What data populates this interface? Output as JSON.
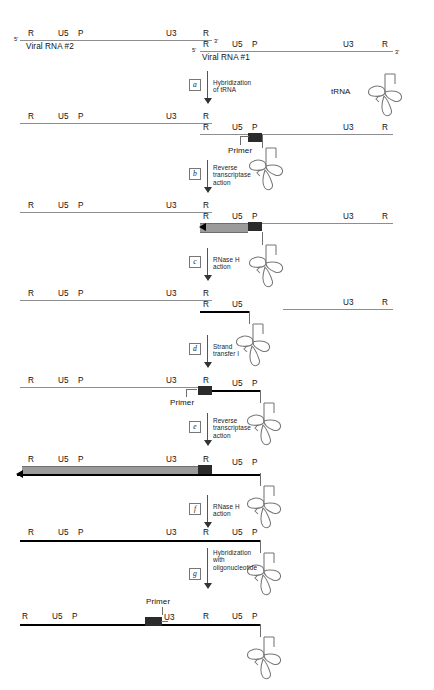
{
  "figure": {
    "colors": {
      "rna_strand": "#8e8e8e",
      "dna_strand": "#000000",
      "primer_block": "#2b2b2b",
      "synthesized_dna_bar": "#9b9b9b",
      "trna_outline": "#777777",
      "background": "#ffffff"
    }
  },
  "segments": {
    "R": "R",
    "U5": "U5",
    "P": "P",
    "U3": "U3",
    "five_prime": "5'",
    "three_prime": "3'"
  },
  "molecules": {
    "viral_rna_2": "Viral RNA #2",
    "viral_rna_1": "Viral RNA #1",
    "trna": "tRNA",
    "primer": "Primer"
  },
  "steps": [
    {
      "id": "a",
      "label": "a",
      "text": "Hybridization\nof tRNA"
    },
    {
      "id": "b",
      "label": "b",
      "text": "Reverse\ntranscriptase\naction"
    },
    {
      "id": "c",
      "label": "c",
      "text": "RNase H\naction"
    },
    {
      "id": "d",
      "label": "d",
      "text": "Strand\ntransfer I"
    },
    {
      "id": "e",
      "label": "e",
      "text": "Reverse\ntranscriptase\naction"
    },
    {
      "id": "f",
      "label": "f",
      "text": "RNase H\naction"
    },
    {
      "id": "g",
      "label": "g",
      "text": "Hybridization\nwith\noligonucleotide"
    }
  ],
  "panels": [
    {
      "id": "panel-1",
      "name": "two-viral-rna-genomes",
      "strands": [
        {
          "name": "viral-rna-2",
          "type": "rna",
          "labels": [
            "R",
            "U5",
            "P",
            "U3",
            "R"
          ],
          "termini": [
            "5'",
            "3'"
          ],
          "molecule": "Viral RNA #2"
        },
        {
          "name": "viral-rna-1",
          "type": "rna",
          "labels": [
            "R",
            "U5",
            "P",
            "U3",
            "R"
          ],
          "termini": [
            "5'",
            "3'"
          ],
          "molecule": "Viral RNA #1"
        }
      ]
    },
    {
      "id": "panel-2",
      "name": "trna-hybridized-to-primer-binding-site",
      "strands": [
        {
          "name": "viral-rna-2",
          "type": "rna",
          "labels": [
            "R",
            "U5",
            "P",
            "U3",
            "R"
          ]
        },
        {
          "name": "viral-rna-1",
          "type": "rna",
          "labels": [
            "R",
            "U5",
            "P",
            "U3",
            "R"
          ],
          "primer": "Primer"
        }
      ]
    },
    {
      "id": "panel-3",
      "name": "minus-strand-strong-stop-dna-synthesized",
      "strands": [
        {
          "name": "viral-rna-2",
          "type": "rna",
          "labels": [
            "R",
            "U5",
            "P",
            "U3",
            "R"
          ]
        },
        {
          "name": "viral-rna-1",
          "type": "rna",
          "labels": [
            "R",
            "U5",
            "P",
            "U3",
            "R"
          ],
          "nascent_dna": true
        }
      ]
    },
    {
      "id": "panel-4",
      "name": "rnase-h-degrades-rna-template",
      "strands": [
        {
          "name": "viral-rna-2",
          "type": "rna",
          "labels": [
            "R",
            "U5",
            "P",
            "U3",
            "R"
          ]
        },
        {
          "name": "minus-strand-dna",
          "type": "dna",
          "labels": [
            "R",
            "U5"
          ]
        },
        {
          "name": "viral-rna-1-remnant",
          "type": "rna",
          "labels": [
            "U3",
            "R"
          ]
        }
      ]
    },
    {
      "id": "panel-5",
      "name": "after-strand-transfer-one",
      "strands": [
        {
          "name": "viral-rna-2",
          "type": "rna",
          "labels": [
            "R",
            "U5",
            "P",
            "U3",
            "R"
          ],
          "primer": "Primer"
        },
        {
          "name": "minus-strand-dna",
          "type": "dna",
          "labels": [
            "R",
            "U5",
            "P"
          ]
        }
      ]
    },
    {
      "id": "panel-6",
      "name": "minus-strand-dna-extended",
      "strands": [
        {
          "name": "viral-rna-2-template",
          "type": "rna",
          "labels": [
            "R",
            "U5",
            "P",
            "U3",
            "R"
          ],
          "nascent_dna": true
        },
        {
          "name": "minus-strand-dna",
          "type": "dna",
          "labels": [
            "U5",
            "P"
          ]
        }
      ]
    },
    {
      "id": "panel-7",
      "name": "full-length-minus-strand-dna",
      "strands": [
        {
          "name": "minus-strand-dna",
          "type": "dna",
          "labels": [
            "R",
            "U5",
            "P",
            "U3",
            "R",
            "U5",
            "P"
          ]
        }
      ]
    },
    {
      "id": "panel-8",
      "name": "oligonucleotide-primer-hybridized",
      "strands": [
        {
          "name": "minus-strand-dna",
          "type": "dna",
          "labels": [
            "R",
            "U5",
            "P",
            "U3",
            "R",
            "U5",
            "P"
          ],
          "primer": "Primer"
        }
      ]
    }
  ]
}
